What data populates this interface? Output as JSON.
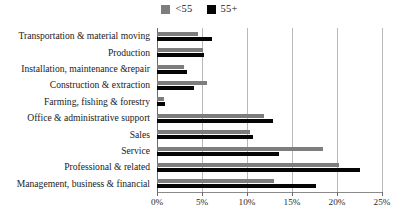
{
  "chart_data": {
    "type": "bar",
    "orientation": "horizontal",
    "title": "",
    "xlabel": "",
    "ylabel": "",
    "xlim": [
      0,
      25
    ],
    "xtick_labels": [
      "0%",
      "5%",
      "10%",
      "15%",
      "20%",
      "25%"
    ],
    "xticks": [
      0,
      5,
      10,
      15,
      20,
      25
    ],
    "grid": true,
    "legend_position": "top-center",
    "categories": [
      "Transportation & material moving",
      "Production",
      "Installation, maintenance &repair",
      "Construction & extraction",
      "Farming, fishing & forestry",
      "Office & administrative support",
      "Sales",
      "Service",
      "Professional & related",
      "Management, business & financial"
    ],
    "series": [
      {
        "name": "<55",
        "color": "#7d7d7d",
        "values": [
          4.6,
          5.1,
          3.0,
          5.6,
          0.8,
          11.9,
          10.3,
          18.4,
          20.2,
          13.0
        ]
      },
      {
        "name": "55+",
        "color": "#050505",
        "values": [
          6.1,
          5.2,
          3.3,
          4.1,
          0.9,
          12.9,
          10.7,
          13.5,
          22.6,
          17.7
        ]
      }
    ]
  },
  "legend": {
    "entries": [
      {
        "label": "<55",
        "color": "#7d7d7d",
        "swatch_name": "legend-swatch-under55"
      },
      {
        "label": "55+",
        "color": "#050505",
        "swatch_name": "legend-swatch-over55"
      }
    ]
  }
}
